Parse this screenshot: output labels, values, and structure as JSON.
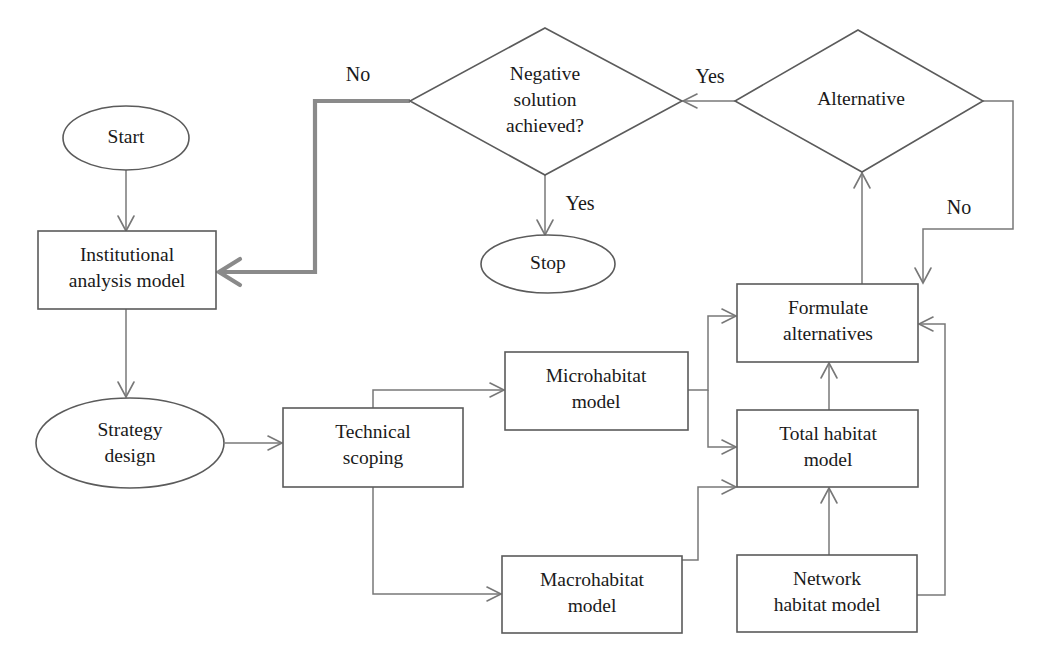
{
  "diagram": {
    "background_color": "#ffffff",
    "line_color": "#787878",
    "highlight_line_color": "#8a8a8a",
    "text_color": "#1a1a1a",
    "nodes": [
      {
        "id": "start",
        "shape": "ellipse",
        "label": "Start"
      },
      {
        "id": "institutional",
        "shape": "rect",
        "label_line1": "Institutional",
        "label_line2": "analysis model"
      },
      {
        "id": "strategy",
        "shape": "ellipse",
        "label_line1": "Strategy",
        "label_line2": "design"
      },
      {
        "id": "technical",
        "shape": "rect",
        "label_line1": "Technical",
        "label_line2": "scoping"
      },
      {
        "id": "micro",
        "shape": "rect",
        "label_line1": "Microhabitat",
        "label_line2": "model"
      },
      {
        "id": "macro",
        "shape": "rect",
        "label_line1": "Macrohabitat",
        "label_line2": "model"
      },
      {
        "id": "network",
        "shape": "rect",
        "label_line1": "Network",
        "label_line2": "habitat model"
      },
      {
        "id": "total",
        "shape": "rect",
        "label_line1": "Total habitat",
        "label_line2": "model"
      },
      {
        "id": "formulate",
        "shape": "rect",
        "label_line1": "Formulate",
        "label_line2": "alternatives"
      },
      {
        "id": "alternative",
        "shape": "diamond",
        "label": "Alternative"
      },
      {
        "id": "negative",
        "shape": "diamond",
        "label_line1": "Negative",
        "label_line2": "solution",
        "label_line3": "achieved?"
      },
      {
        "id": "stop",
        "shape": "ellipse",
        "label": "Stop"
      }
    ],
    "edge_labels": {
      "negative_no": "No",
      "negative_yes": "Yes",
      "alternative_yes": "Yes",
      "alternative_no": "No"
    }
  }
}
